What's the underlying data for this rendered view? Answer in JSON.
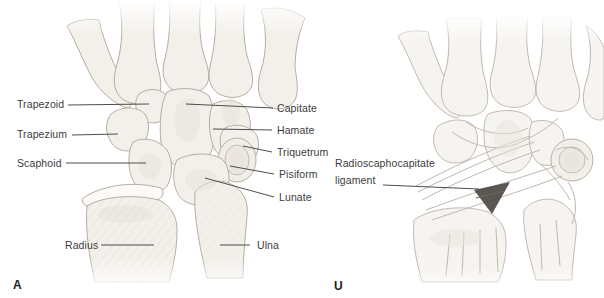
{
  "figure_type": "anatomical diagram, dorsal view of wrist bones and ligaments",
  "colors": {
    "background": "#ffffff",
    "label_text": "#3c3c3c",
    "leader_line": "#4d4d4d",
    "bone_fill": "#f3f0eb",
    "bone_outline": "#b6ada2",
    "ligament_fiber": "#c0b8ae",
    "dark_gap": "#44403a"
  },
  "panel_a": {
    "letter": "A",
    "left_labels": [
      "Trapezoid",
      "Trapezium",
      "Scaphoid",
      "Radius"
    ],
    "right_labels": [
      "Capitate",
      "Hamate",
      "Triquetrum",
      "Pisiform",
      "Lunate",
      "Ulna"
    ]
  },
  "panel_b": {
    "letter": "U",
    "ligament_label": {
      "line1": "Radioscaphocapitate",
      "line2": "ligament"
    }
  }
}
